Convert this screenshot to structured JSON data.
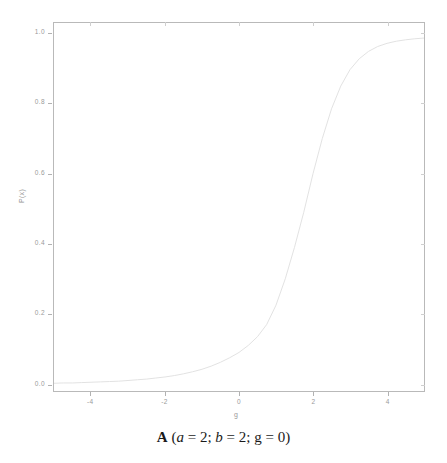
{
  "figure": {
    "panel_letter": "A",
    "caption_open": "(",
    "caption_close": ")",
    "caption_params": [
      {
        "name": "a",
        "italic": true,
        "eq": " = ",
        "value": "2",
        "sep": "; "
      },
      {
        "name": "b",
        "italic": true,
        "eq": " = ",
        "value": "2",
        "sep": "; "
      },
      {
        "name": "g",
        "italic": false,
        "eq": " = ",
        "value": "0",
        "sep": ""
      }
    ],
    "caption_text": "A (a = 2; b = 2; g = 0)"
  },
  "chart_data": {
    "type": "line",
    "title": "",
    "subtitle": "",
    "xlabel": "g",
    "ylabel": "P(x)",
    "xlim": [
      -5,
      5
    ],
    "ylim": [
      -0.02,
      1.03
    ],
    "xticks": [
      -4,
      -2,
      0,
      2,
      4
    ],
    "xticklabels": [
      "-4",
      "-2",
      "0",
      "2",
      "4"
    ],
    "yticks": [
      0.0,
      0.2,
      0.4,
      0.6,
      0.8,
      1.0
    ],
    "yticklabels": [
      "0.0",
      "0.2",
      "0.4",
      "0.6",
      "0.8",
      "1.0"
    ],
    "grid": false,
    "legend": null,
    "legend_position": "none",
    "series": [
      {
        "name": "P(x)",
        "color": "#e2e2e2",
        "linewidth": 1,
        "x": [
          -5.0,
          -4.75,
          -4.5,
          -4.25,
          -4.0,
          -3.75,
          -3.5,
          -3.25,
          -3.0,
          -2.75,
          -2.5,
          -2.25,
          -2.0,
          -1.75,
          -1.5,
          -1.25,
          -1.0,
          -0.75,
          -0.5,
          -0.25,
          0.0,
          0.25,
          0.5,
          0.75,
          1.0,
          1.25,
          1.5,
          1.75,
          2.0,
          2.25,
          2.5,
          2.75,
          3.0,
          3.25,
          3.5,
          3.75,
          4.0,
          4.25,
          4.5,
          4.75,
          5.0
        ],
        "y": [
          0.002,
          0.003,
          0.003,
          0.004,
          0.005,
          0.006,
          0.007,
          0.008,
          0.01,
          0.012,
          0.014,
          0.017,
          0.02,
          0.024,
          0.029,
          0.035,
          0.042,
          0.051,
          0.062,
          0.075,
          0.09,
          0.11,
          0.135,
          0.17,
          0.225,
          0.3,
          0.39,
          0.49,
          0.6,
          0.7,
          0.785,
          0.85,
          0.897,
          0.928,
          0.949,
          0.963,
          0.972,
          0.978,
          0.982,
          0.985,
          0.987
        ]
      }
    ]
  },
  "axes": {
    "frame_color": "#b9b9b9",
    "tick_color": "#b2b2b2",
    "tick_label_color": "#9a9a9a",
    "background": "#ffffff"
  }
}
